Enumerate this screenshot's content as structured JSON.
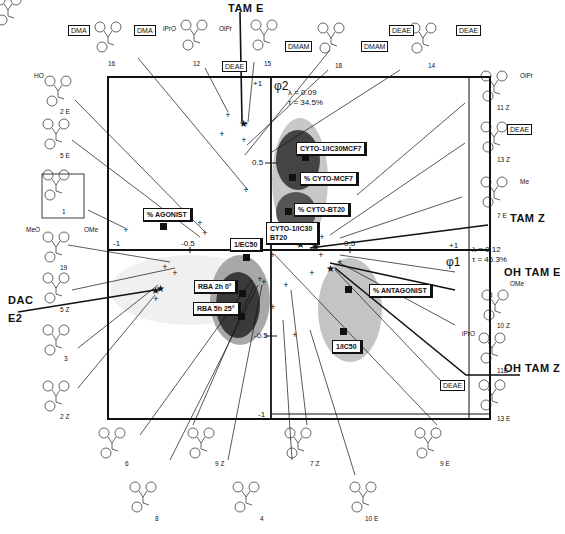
{
  "figure": {
    "type": "factorial-analysis-biplot",
    "axes": {
      "x_axis": {
        "label": "φ1",
        "ticks": [
          "-1",
          "-0.5",
          "0.5",
          "+1"
        ],
        "lambda": "λ = 0.12",
        "tau": "τ = 45.3%"
      },
      "y_axis": {
        "label": "φ2",
        "ticks": [
          "+1",
          "0.5",
          "-0.5",
          "-1"
        ],
        "lambda": "λ = 0.09",
        "tau": "τ = 34.5%"
      }
    },
    "variables": [
      {
        "id": "cyto-ic30-mcf7",
        "label": "CYTO-1/IC30MCF7"
      },
      {
        "id": "pct-cyto-mcf7",
        "label": "% CYTO-MCF7"
      },
      {
        "id": "pct-cyto-bt20",
        "label": "% CYTO-BT20"
      },
      {
        "id": "cyto-ic30-bt20",
        "label": "CYTO-1/IC30 BT20"
      },
      {
        "id": "pct-agonist",
        "label": "% AGONIST"
      },
      {
        "id": "ec50",
        "label": "1/EC50"
      },
      {
        "id": "rba-2h",
        "label": "RBA 2h 0°"
      },
      {
        "id": "rba-5h",
        "label": "RBA 5h 25°"
      },
      {
        "id": "pct-antagonist",
        "label": "% ANTAGONIST"
      },
      {
        "id": "ic50",
        "label": "1/IC50"
      }
    ],
    "references": {
      "tam_e": "TAM E",
      "tam_z": "TAM Z",
      "oh_tam_e": "OH TAM E",
      "oh_tam_z": "OH TAM Z",
      "dac": "DAC",
      "e2": "E2"
    },
    "compounds": [
      {
        "id": "16",
        "label": "16",
        "substituents": [
          "DMA",
          "DMA"
        ]
      },
      {
        "id": "12",
        "label": "12",
        "substituents": [
          "iPrO",
          "OiPr"
        ]
      },
      {
        "id": "15",
        "label": "15",
        "substituents": [
          "DEAE"
        ]
      },
      {
        "id": "18",
        "label": "18",
        "substituents": [
          "HO",
          "OH",
          "DMAM",
          "DMAM"
        ]
      },
      {
        "id": "14",
        "label": "14",
        "substituents": [
          "DEAE",
          "DEAE"
        ]
      },
      {
        "id": "2E",
        "label": "2 E",
        "substituents": [
          "HO"
        ]
      },
      {
        "id": "5E",
        "label": "5 E",
        "substituents": [
          "HO",
          "HO"
        ]
      },
      {
        "id": "1",
        "label": "1",
        "substituents": []
      },
      {
        "id": "19",
        "label": "19",
        "substituents": [
          "MeO",
          "OMe"
        ]
      },
      {
        "id": "5Z",
        "label": "5 Z",
        "substituents": [
          "OH",
          "HO"
        ]
      },
      {
        "id": "3",
        "label": "3",
        "substituents": [
          "HO"
        ]
      },
      {
        "id": "2Z",
        "label": "2 Z",
        "substituents": [
          "OH"
        ]
      },
      {
        "id": "11Z",
        "label": "11 Z",
        "substituents": [
          "HO",
          "OiPr"
        ]
      },
      {
        "id": "13Z",
        "label": "13 Z",
        "substituents": [
          "HO",
          "DEAE"
        ]
      },
      {
        "id": "7E",
        "label": "7 E",
        "substituents": [
          "HO",
          "Me"
        ]
      },
      {
        "id": "10Z",
        "label": "10 Z",
        "substituents": [
          "HO",
          "OMe"
        ]
      },
      {
        "id": "11E",
        "label": "11E",
        "substituents": [
          "iPrO",
          "OH"
        ]
      },
      {
        "id": "13E",
        "label": "13 E",
        "substituents": [
          "DEAE",
          "OH"
        ]
      },
      {
        "id": "6",
        "label": "6",
        "substituents": [
          "HO",
          "OH",
          "HO"
        ]
      },
      {
        "id": "9Z",
        "label": "9 Z",
        "substituents": [
          "Me",
          "OH",
          "HO"
        ]
      },
      {
        "id": "7Z",
        "label": "7 Z",
        "substituents": [
          "Me",
          "OH"
        ]
      },
      {
        "id": "9E",
        "label": "9 E",
        "substituents": [
          "HO",
          "Me",
          "HO"
        ]
      },
      {
        "id": "8",
        "label": "8",
        "substituents": [
          "HO",
          "OH",
          "Me"
        ]
      },
      {
        "id": "4",
        "label": "4",
        "substituents": [
          "HO",
          "OH"
        ]
      },
      {
        "id": "10E",
        "label": "10 E",
        "substituents": [
          "MeO",
          "OH"
        ]
      }
    ],
    "cn_label": "CN",
    "colors": {
      "ink": "#111111",
      "cluster_light": "#cfcfcf",
      "cluster_mid": "#9a9a9a",
      "cluster_dark": "#3a3a3a"
    }
  }
}
